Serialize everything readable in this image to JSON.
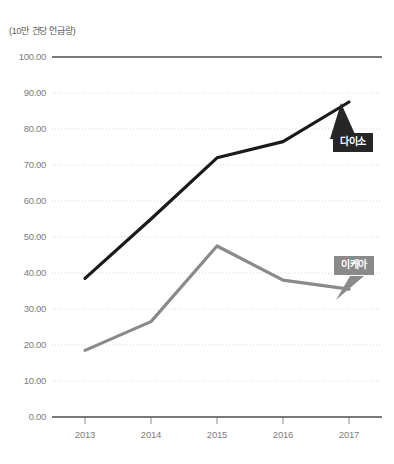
{
  "chart_data": {
    "type": "line",
    "title": "",
    "unit_note": "(10만 건당 언급량)",
    "xlabel": "",
    "ylabel": "",
    "categories": [
      "2013",
      "2014",
      "2015",
      "2016",
      "2017"
    ],
    "ylim": [
      0,
      100
    ],
    "ytick_step": 10,
    "ytick_labels": [
      "0.00",
      "10.00",
      "20.00",
      "30.00",
      "40.00",
      "50.00",
      "60.00",
      "70.00",
      "80.00",
      "90.00",
      "100.00"
    ],
    "grid": true,
    "grid_style": "dotted",
    "legend_position": "inline-callout",
    "series": [
      {
        "name": "다이소",
        "color": "#1a1a1a",
        "values": [
          38.5,
          55.0,
          72.0,
          76.5,
          87.5
        ]
      },
      {
        "name": "이케아",
        "color": "#8a8a8a",
        "values": [
          18.5,
          26.5,
          47.5,
          38.0,
          35.5
        ]
      }
    ]
  },
  "colors": {
    "daiso": "#1a1a1a",
    "ikea": "#8a8a8a",
    "axis": "#4d4d4d",
    "grid": "#d9d9d9",
    "tick_text": "#7d7d7d"
  }
}
